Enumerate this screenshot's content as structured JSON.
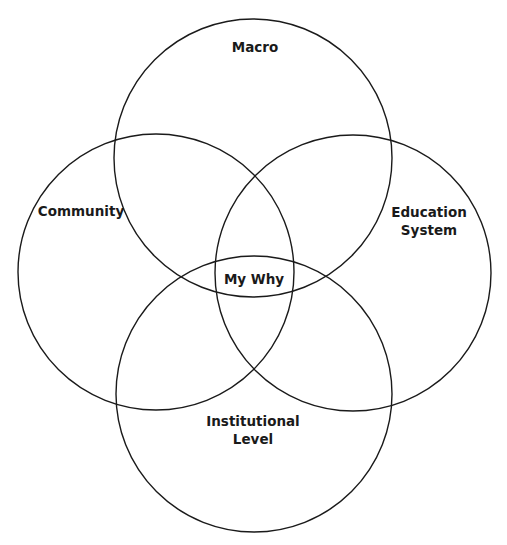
{
  "diagram": {
    "type": "venn",
    "stroke_color": "#1a1a1a",
    "background": "#ffffff",
    "circles": [
      {
        "id": "macro",
        "label_lines": [
          "Macro"
        ],
        "cx": 253,
        "cy": 158,
        "r": 139,
        "label_x": 255,
        "label_y": 47
      },
      {
        "id": "community",
        "label_lines": [
          "Community"
        ],
        "cx": 156,
        "cy": 272,
        "r": 138,
        "label_x": 81,
        "label_y": 211
      },
      {
        "id": "education-system",
        "label_lines": [
          "Education",
          "System"
        ],
        "cx": 353,
        "cy": 273,
        "r": 138,
        "label_x": 429,
        "label_y": 221
      },
      {
        "id": "institutional-level",
        "label_lines": [
          "Institutional",
          "Level"
        ],
        "cx": 254,
        "cy": 394,
        "r": 138,
        "label_x": 253,
        "label_y": 430
      }
    ],
    "center": {
      "label": "My Why",
      "x": 254,
      "y": 279
    }
  }
}
